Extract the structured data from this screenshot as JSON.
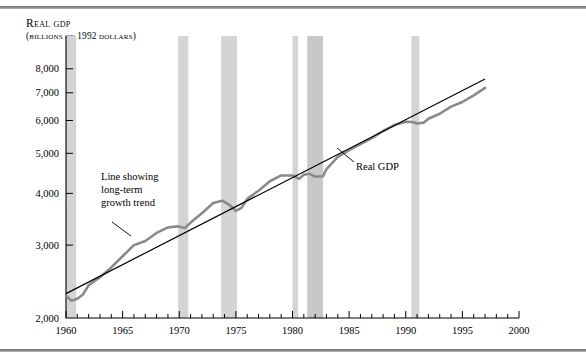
{
  "chart_data": {
    "type": "line",
    "title": "Real GDP",
    "subtitle": "(Billions of 1992 dollars)",
    "xlabel": "",
    "ylabel": "Real GDP (billions of 1992 dollars)",
    "yscale": "log",
    "ylim": [
      2000,
      8400
    ],
    "xlim": [
      1960,
      2000
    ],
    "grid": false,
    "legend_position": "inline-annotations",
    "y_ticks": [
      2000,
      3000,
      4000,
      5000,
      6000,
      7000,
      8000
    ],
    "y_tick_labels": [
      "2,000",
      "3,000",
      "4,000",
      "5,000",
      "6,000",
      "7,000",
      "8,000"
    ],
    "x_ticks": [
      1960,
      1965,
      1970,
      1975,
      1980,
      1985,
      1990,
      1995,
      2000
    ],
    "x_tick_labels": [
      "1960",
      "1965",
      "1970",
      "1975",
      "1980",
      "1985",
      "1990",
      "1995",
      "2000"
    ],
    "x_minor_tick_interval": 1,
    "annotations": [
      {
        "name": "trend-annotation",
        "lines": [
          "Line showing",
          "long-term",
          "growth trend"
        ],
        "text": "Line showing long-term growth trend",
        "points_to_year": 1966.5
      },
      {
        "name": "real-gdp-annotation",
        "lines": [
          "Real GDP"
        ],
        "text": "Real GDP",
        "points_to_year": 1982.8
      }
    ],
    "recession_bands": [
      {
        "start": 1960.0,
        "end": 1960.9
      },
      {
        "start": 1969.9,
        "end": 1970.8
      },
      {
        "start": 1973.7,
        "end": 1975.1
      },
      {
        "start": 1980.0,
        "end": 1980.5
      },
      {
        "start": 1981.3,
        "end": 1982.7
      },
      {
        "start": 1990.5,
        "end": 1991.2
      }
    ],
    "series": [
      {
        "name": "Real GDP",
        "color": "#8a8a8a",
        "style": "fluctuating",
        "x": [
          1960,
          1960.5,
          1961,
          1961.5,
          1962,
          1963,
          1964,
          1965,
          1966,
          1967,
          1968,
          1969,
          1969.8,
          1970.5,
          1971,
          1972,
          1973,
          1973.8,
          1974.5,
          1975,
          1975.5,
          1976,
          1977,
          1978,
          1979,
          1980,
          1980.6,
          1981,
          1981.5,
          1982,
          1982.7,
          1983,
          1984,
          1985,
          1986,
          1987,
          1988,
          1989,
          1990,
          1990.6,
          1991,
          1991.6,
          1992,
          1993,
          1994,
          1995,
          1996,
          1997
        ],
        "y": [
          2263,
          2200,
          2225,
          2280,
          2400,
          2510,
          2650,
          2820,
          3000,
          3070,
          3210,
          3310,
          3330,
          3300,
          3400,
          3580,
          3790,
          3840,
          3740,
          3630,
          3690,
          3880,
          4060,
          4280,
          4420,
          4420,
          4340,
          4440,
          4460,
          4390,
          4400,
          4580,
          4900,
          5090,
          5260,
          5440,
          5660,
          5850,
          5960,
          5950,
          5900,
          5930,
          6060,
          6230,
          6480,
          6650,
          6900,
          7190
        ]
      },
      {
        "name": "Line showing long-term growth trend",
        "color": "#000000",
        "style": "straight-trend",
        "x": [
          1960,
          1997
        ],
        "y": [
          2290,
          7560
        ]
      }
    ]
  },
  "figure": {
    "top_rule": "horizontal-rule",
    "bottom_rule": "horizontal-rule"
  }
}
